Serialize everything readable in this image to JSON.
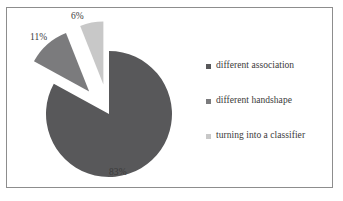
{
  "chart_data": {
    "type": "pie",
    "title": "",
    "subtitle": "",
    "xlabel": "",
    "ylabel": "",
    "legend_position": "right",
    "grid": false,
    "exploded": true,
    "categories": [
      "different association",
      "different handshape",
      "turning into a classifier"
    ],
    "values": [
      83,
      11,
      6
    ],
    "value_labels": [
      "83%",
      "11%",
      "6%"
    ],
    "colors": [
      "#58585a",
      "#7b7b7d",
      "#c8c8c8"
    ],
    "slices": [
      {
        "label": "different association",
        "value": 83,
        "value_label": "83%",
        "color": "#58585a",
        "exploded": false
      },
      {
        "label": "different handshape",
        "value": 11,
        "value_label": "11%",
        "color": "#7b7b7d",
        "exploded": true
      },
      {
        "label": "turning into a classifier",
        "value": 6,
        "value_label": "6%",
        "color": "#c8c8c8",
        "exploded": true
      }
    ]
  },
  "legend": {
    "items": [
      {
        "label": "different association",
        "marker": "square-marker",
        "color": "#58585a"
      },
      {
        "label": "different handshape",
        "marker": "square-marker",
        "color": "#7b7b7d"
      },
      {
        "label": "turning into a classifier",
        "marker": "square-marker",
        "color": "#c8c8c8"
      }
    ]
  },
  "style": {
    "background": "#ffffff",
    "border_color": "#8d8d8d",
    "text_color": "#3a3a3a"
  }
}
